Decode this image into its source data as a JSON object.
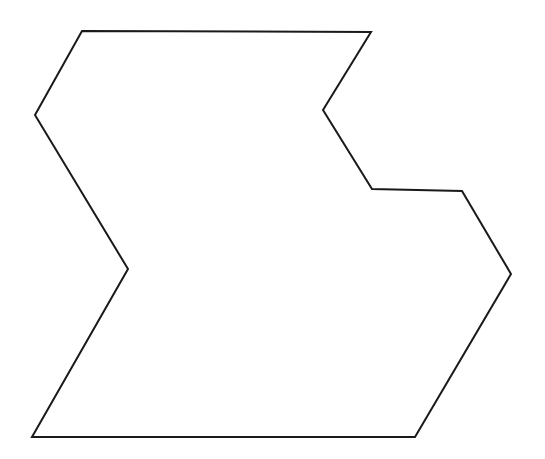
{
  "figure": {
    "name": "concave-polygon",
    "background_color": "#ffffff",
    "stroke_color": "#1a1a1a",
    "fill_color": "#ffffff",
    "stroke_width": 2,
    "canvas_width": 545,
    "canvas_height": 459
  },
  "chart_data": {
    "type": "scatter",
    "title": "",
    "xlabel": "",
    "ylabel": "",
    "grid": false,
    "legend": "none",
    "xlim": [
      0,
      545
    ],
    "ylim": [
      0,
      459
    ],
    "shape_kind": "concave decagon",
    "vertex_count": 10,
    "closed": true,
    "vertices": [
      {
        "label": "top-left-corner",
        "x": 82,
        "y": 31
      },
      {
        "label": "top-right-corner",
        "x": 371,
        "y": 32
      },
      {
        "label": "upper-right-notch-inner",
        "x": 323,
        "y": 110
      },
      {
        "label": "right-notch-lower-left",
        "x": 372,
        "y": 189
      },
      {
        "label": "right-ledge-end",
        "x": 462,
        "y": 191
      },
      {
        "label": "rightmost-point",
        "x": 511,
        "y": 274
      },
      {
        "label": "bottom-right-corner",
        "x": 415,
        "y": 437
      },
      {
        "label": "bottom-left-corner",
        "x": 32,
        "y": 437
      },
      {
        "label": "left-notch-inner-point",
        "x": 128,
        "y": 269
      },
      {
        "label": "left-notch-outer-point",
        "x": 35,
        "y": 115
      }
    ],
    "x": [
      82,
      371,
      323,
      372,
      462,
      511,
      415,
      32,
      128,
      35
    ],
    "y": [
      31,
      32,
      110,
      189,
      191,
      274,
      437,
      437,
      269,
      115
    ],
    "points_path": "82,31 371,32 323,110 372,189 462,191 511,274 415,437 32,437 128,269 35,115"
  }
}
